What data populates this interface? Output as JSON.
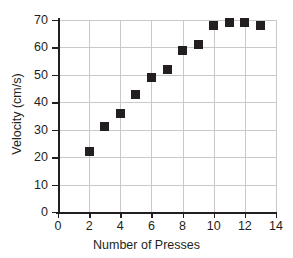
{
  "chart_data": {
    "type": "scatter",
    "title": "",
    "xlabel": "Number of Presses",
    "ylabel": "Velocity (cm/s)",
    "xlim": [
      0,
      14
    ],
    "ylim": [
      0,
      70
    ],
    "xticks": [
      0,
      2,
      4,
      6,
      8,
      10,
      12,
      14
    ],
    "yticks": [
      0,
      10,
      20,
      30,
      40,
      50,
      60,
      70
    ],
    "grid": true,
    "legend": null,
    "marker": "square",
    "marker_color": "#231f20",
    "x": [
      2,
      3,
      4,
      5,
      6,
      7,
      8,
      9,
      10,
      11,
      12,
      13
    ],
    "values": [
      22,
      31,
      36,
      43,
      49,
      52,
      59,
      61,
      68,
      69,
      69,
      68
    ],
    "points": [
      {
        "x": 2,
        "y": 22
      },
      {
        "x": 3,
        "y": 31
      },
      {
        "x": 4,
        "y": 36
      },
      {
        "x": 5,
        "y": 43
      },
      {
        "x": 6,
        "y": 49
      },
      {
        "x": 7,
        "y": 52
      },
      {
        "x": 8,
        "y": 59
      },
      {
        "x": 9,
        "y": 61
      },
      {
        "x": 10,
        "y": 68
      },
      {
        "x": 11,
        "y": 69
      },
      {
        "x": 12,
        "y": 69
      },
      {
        "x": 13,
        "y": 68
      }
    ]
  },
  "axes": {
    "x_title": "Number of Presses",
    "y_title": "Velocity (cm/s)",
    "x_tick_labels": [
      "0",
      "2",
      "4",
      "6",
      "8",
      "10",
      "12",
      "14"
    ],
    "y_tick_labels": [
      "0",
      "10",
      "20",
      "30",
      "40",
      "50",
      "60",
      "70"
    ]
  },
  "colors": {
    "marker": "#231f20",
    "gridline": "#c9c9c9",
    "axis": "#231f20",
    "background": "#ffffff"
  }
}
